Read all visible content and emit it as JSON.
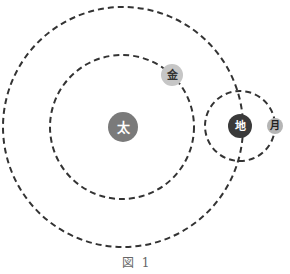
{
  "diagram": {
    "type": "orbital-diagram",
    "caption": "図 1",
    "bodies": [
      {
        "id": "sun",
        "label": "太",
        "cx": 123,
        "cy": 127,
        "r": 15,
        "fill": "#7a7a7a",
        "text_color": "#ffffff",
        "font_size": 13
      },
      {
        "id": "venus",
        "label": "金",
        "cx": 172,
        "cy": 75,
        "r": 11,
        "fill": "#c6c6c6",
        "text_color": "#333333",
        "font_size": 11
      },
      {
        "id": "earth",
        "label": "地",
        "cx": 240,
        "cy": 126,
        "r": 12,
        "fill": "#3a3a3a",
        "text_color": "#ffffff",
        "font_size": 11
      },
      {
        "id": "moon",
        "label": "月",
        "cx": 275,
        "cy": 126,
        "r": 8,
        "fill": "#b5b5b5",
        "text_color": "#222222",
        "font_size": 10
      }
    ],
    "orbits": [
      {
        "id": "venus-orbit",
        "cx": 122,
        "cy": 127,
        "r": 72,
        "stroke": "#333333",
        "dash": "6,4"
      },
      {
        "id": "earth-orbit",
        "cx": 123,
        "cy": 127,
        "r": 120,
        "stroke": "#333333",
        "dash": "6,4"
      },
      {
        "id": "moon-orbit",
        "cx": 240,
        "cy": 126,
        "r": 35,
        "stroke": "#333333",
        "dash": "6,4"
      }
    ]
  }
}
